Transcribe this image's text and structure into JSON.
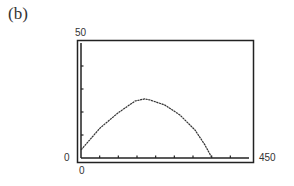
{
  "panel": {
    "label": "(b)"
  },
  "window": {
    "ymax_label": "50",
    "ymin_label": "0",
    "xmin_label": "0",
    "xmax_label": "450"
  },
  "chart_data": {
    "type": "line",
    "title": "",
    "panel_label": "(b)",
    "xlabel": "",
    "ylabel": "",
    "xlim": [
      0,
      450
    ],
    "ylim": [
      0,
      50
    ],
    "x_tick_interval": 50,
    "y_tick_interval": 10,
    "grid": false,
    "legend": null,
    "series": [
      {
        "name": "path",
        "x": [
          0,
          51,
          99,
          145,
          171,
          185,
          225,
          265,
          305,
          332,
          351
        ],
        "y": [
          3.5,
          13,
          19.6,
          24.8,
          25.7,
          25.2,
          23,
          18.7,
          12.2,
          5.7,
          0
        ]
      }
    ],
    "annotations": [
      "50",
      "0",
      "0",
      "450"
    ],
    "style": "graphing-calculator window"
  },
  "colors": {
    "axis": "#222222",
    "curve": "#333333",
    "background": "#ffffff"
  }
}
